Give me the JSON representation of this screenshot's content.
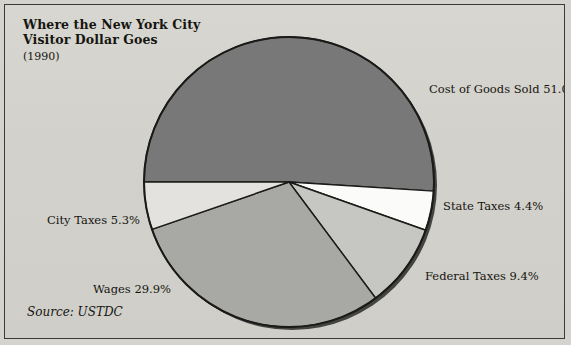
{
  "title": {
    "line1": "Where the New York City",
    "line2": "Visitor Dollar Goes",
    "year": "(1990)"
  },
  "source": "Source: USTDC",
  "colors": {
    "background": "#d5d3ce",
    "frame_border": "#3a3a38",
    "slice_outline": "#1a1a18",
    "cost_of_goods": "#787878",
    "state_taxes": "#fbfbf9",
    "federal_taxes": "#c6c6c2",
    "wages": "#a8a8a4",
    "city_taxes": "#e3e2de",
    "text": "#15150f"
  },
  "labels": {
    "cost_of_goods": "Cost of Goods Sold 51.0%",
    "state_taxes": "State Taxes 4.4%",
    "federal_taxes": "Federal Taxes 9.4%",
    "city_taxes": "City Taxes 5.3%",
    "wages": "Wages 29.9%"
  },
  "chart_data": {
    "type": "pie",
    "title": "Where the New York City Visitor Dollar Goes",
    "subtitle": "(1990)",
    "source": "Source: USTDC",
    "unit": "percent",
    "start_angle_deg": 180,
    "direction": "clockwise",
    "legend": "none (direct labels)",
    "categories": [
      "Cost of Goods Sold",
      "State Taxes",
      "Federal Taxes",
      "Wages",
      "City Taxes"
    ],
    "values": [
      51.0,
      4.4,
      9.4,
      29.9,
      5.3
    ],
    "slices": [
      {
        "label": "Cost of Goods Sold",
        "value": 51.0,
        "display": "Cost of Goods Sold 51.0%",
        "color": "#787878"
      },
      {
        "label": "State Taxes",
        "value": 4.4,
        "display": "State Taxes 4.4%",
        "color": "#fbfbf9"
      },
      {
        "label": "Federal Taxes",
        "value": 9.4,
        "display": "Federal Taxes 9.4%",
        "color": "#c6c6c2"
      },
      {
        "label": "Wages",
        "value": 29.9,
        "display": "Wages 29.9%",
        "color": "#a8a8a4"
      },
      {
        "label": "City Taxes",
        "value": 5.3,
        "display": "City Taxes 5.3%",
        "color": "#e3e2de"
      }
    ]
  }
}
